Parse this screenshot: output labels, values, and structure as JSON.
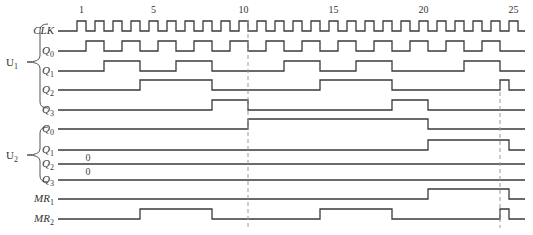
{
  "diagram": {
    "x_start": 58,
    "x_end": 525,
    "clock": {
      "period_px": 18,
      "first_rise_x": 77,
      "pulse_width_px": 9,
      "count": 25,
      "tick_labels": [
        {
          "n": 1,
          "label": "1"
        },
        {
          "n": 5,
          "label": "5"
        },
        {
          "n": 10,
          "label": "10"
        },
        {
          "n": 15,
          "label": "15"
        },
        {
          "n": 20,
          "label": "20"
        },
        {
          "n": 25,
          "label": "25"
        }
      ]
    },
    "groups": [
      {
        "name": "U1",
        "label": "U",
        "sub": "1",
        "y_top": 24,
        "y_bottom": 108,
        "y_mid": 62
      },
      {
        "name": "U2",
        "label": "U",
        "sub": "2",
        "y_top": 127,
        "y_bottom": 182,
        "y_mid": 155
      }
    ],
    "signals": [
      {
        "id": "u1-clk",
        "label": "CLK",
        "sub": "",
        "y_low": 31,
        "y_high": 21,
        "type": "clock"
      },
      {
        "id": "u1-q0",
        "label": "Q",
        "sub": "0",
        "y_low": 51,
        "y_high": 41,
        "edges": [
          86,
          104,
          122,
          140,
          158,
          176,
          194,
          212,
          230,
          248,
          266,
          284,
          302,
          320,
          338,
          356,
          374,
          392,
          410,
          428,
          446,
          464,
          482,
          500
        ],
        "init": 0
      },
      {
        "id": "u1-q1",
        "label": "Q",
        "sub": "1",
        "y_low": 71,
        "y_high": 61,
        "edges": [
          104,
          140,
          176,
          212,
          284,
          320,
          356,
          392,
          464,
          500
        ],
        "init": 0
      },
      {
        "id": "u1-q2",
        "label": "Q",
        "sub": "2",
        "y_low": 90,
        "y_high": 80,
        "edges": [
          140,
          212,
          320,
          392,
          500,
          509
        ],
        "init": 0
      },
      {
        "id": "u1-q3",
        "label": "Q",
        "sub": "3",
        "y_low": 110,
        "y_high": 100,
        "edges": [
          212,
          248,
          392,
          428
        ],
        "init": 0
      },
      {
        "id": "u2-q0",
        "label": "Q",
        "sub": "0",
        "y_low": 129,
        "y_high": 119,
        "edges": [
          248,
          428
        ],
        "init": 0
      },
      {
        "id": "u2-q1",
        "label": "Q",
        "sub": "1",
        "y_low": 150,
        "y_high": 140,
        "edges": [
          428,
          509
        ],
        "init": 0
      },
      {
        "id": "u2-q2",
        "label": "Q",
        "sub": "2",
        "y_low": 164,
        "y_high": 154,
        "edges": [],
        "init": 0,
        "value_note": "0"
      },
      {
        "id": "u2-q3",
        "label": "Q",
        "sub": "3",
        "y_low": 180,
        "y_high": 170,
        "edges": [],
        "init": 0,
        "value_note": "0"
      },
      {
        "id": "mr1",
        "label": "MR",
        "sub": "1",
        "y_low": 199,
        "y_high": 189,
        "edges": [
          428,
          509
        ],
        "init": 0
      },
      {
        "id": "mr2",
        "label": "MR",
        "sub": "2",
        "y_low": 219,
        "y_high": 209,
        "edges": [
          140,
          212,
          320,
          392,
          500,
          509
        ],
        "init": 0
      }
    ],
    "zero_notes": [
      {
        "text": "0",
        "x": 88,
        "y": 161
      },
      {
        "text": "0",
        "x": 88,
        "y": 175
      }
    ],
    "dashed_markers": [
      {
        "x": 248,
        "y1": 20,
        "y2": 228
      },
      {
        "x": 500,
        "y1": 85,
        "y2": 228
      }
    ]
  }
}
